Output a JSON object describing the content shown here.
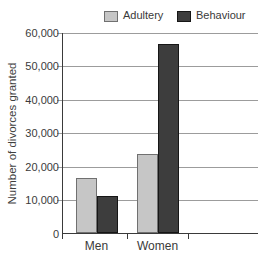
{
  "chart_data": {
    "type": "bar",
    "title": "",
    "xlabel": "",
    "ylabel": "Number of divorces granted",
    "categories": [
      "Men",
      "Women"
    ],
    "series": [
      {
        "name": "Adultery",
        "color": "#c6c6c6",
        "border": "#707070",
        "values": [
          16500,
          23500
        ]
      },
      {
        "name": "Behaviour",
        "color": "#3d3d3d",
        "border": "#161616",
        "values": [
          11000,
          56500
        ]
      }
    ],
    "ylim": [
      0,
      60000
    ],
    "ytick_interval": 10000,
    "ytick_labels": [
      "0",
      "10,000",
      "20,000",
      "30,000",
      "40,000",
      "50,000",
      "60,000"
    ],
    "grid": true,
    "legend_position": "top",
    "colors": {
      "gridline": "#9c9c9c",
      "axis": "#3a3a3a",
      "text": "#3a3a3a"
    }
  }
}
